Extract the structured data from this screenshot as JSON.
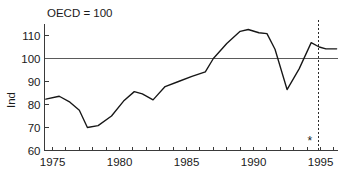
{
  "chart_data": {
    "type": "line",
    "title": "OECD = 100",
    "xlabel": "",
    "ylabel": "Ind",
    "xlim": [
      1974.4,
      1996.3
    ],
    "ylim": [
      60,
      115
    ],
    "grid": false,
    "legend": null,
    "y_ticks": [
      60,
      70,
      80,
      90,
      100,
      110
    ],
    "y_tick_labels": [
      "60",
      "70",
      "80",
      "90",
      "100",
      "110"
    ],
    "x_ticks": [
      1975,
      1976,
      1977,
      1978,
      1979,
      1980,
      1981,
      1982,
      1983,
      1984,
      1985,
      1986,
      1987,
      1988,
      1989,
      1990,
      1991,
      1992,
      1993,
      1994,
      1995,
      1996
    ],
    "x_tick_labels_shown": [
      {
        "value": 1975,
        "label": "1975"
      },
      {
        "value": 1980,
        "label": "1980"
      },
      {
        "value": 1985,
        "label": "1985"
      },
      {
        "value": 1990,
        "label": "1990"
      },
      {
        "value": 1995,
        "label": "1995"
      }
    ],
    "reference_line": {
      "value": 100,
      "label": "OECD = 100"
    },
    "marker_line": {
      "value": 1994.85,
      "style": "dashed"
    },
    "annotations": [
      {
        "text": "*",
        "x": 1994.2,
        "y": 62.5
      }
    ],
    "series": [
      {
        "name": "Ind",
        "x": [
          1974.5,
          1975.5,
          1976.3,
          1977.0,
          1977.6,
          1978.4,
          1979.4,
          1980.3,
          1981.1,
          1981.7,
          1982.5,
          1983.4,
          1984.4,
          1985.4,
          1986.4,
          1987.0,
          1988.0,
          1989.0,
          1989.6,
          1990.4,
          1991.0,
          1991.6,
          1992.5,
          1993.4,
          1994.3,
          1994.9,
          1995.4,
          1996.2
        ],
        "values": [
          82.3,
          83.6,
          81.0,
          77.5,
          70.0,
          70.8,
          75.0,
          81.5,
          85.6,
          84.6,
          82.0,
          87.8,
          90.0,
          92.2,
          94.2,
          100.0,
          106.5,
          111.8,
          112.6,
          111.2,
          110.8,
          104.0,
          86.5,
          95.5,
          106.9,
          105.0,
          104.2,
          104.2
        ]
      }
    ]
  }
}
